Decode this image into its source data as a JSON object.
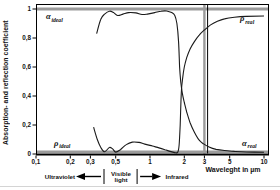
{
  "figure": {
    "axes": {
      "y_title": "Absorption- and reflection coefficient",
      "x_title": "Waveleght in µm",
      "x_scale": "log",
      "y_ticks": [
        {
          "label": "1",
          "value": 1.0
        },
        {
          "label": "0,8",
          "value": 0.8
        },
        {
          "label": "0,6",
          "value": 0.6
        },
        {
          "label": "0,4",
          "value": 0.4
        },
        {
          "label": "0,2",
          "value": 0.2
        },
        {
          "label": "0",
          "value": 0.0
        }
      ],
      "x_ticks": [
        {
          "label": "0,1",
          "value": 0.1
        },
        {
          "label": "0,2",
          "value": 0.2
        },
        {
          "label": "0,3",
          "value": 0.3
        },
        {
          "label": "0,5",
          "value": 0.5
        },
        {
          "label": "1",
          "value": 1
        },
        {
          "label": "2",
          "value": 2
        },
        {
          "label": "3",
          "value": 3
        },
        {
          "label": "5",
          "value": 5
        },
        {
          "label": "10",
          "value": 10
        }
      ]
    },
    "regions": {
      "ultraviolet": "Ultraviolet",
      "visible_line1": "Visible",
      "visible_line2": "light",
      "infrared": "Infrared",
      "separator_values_um": [
        0.395,
        0.77
      ]
    },
    "curve_labels": {
      "alpha_ideal": {
        "main": "α",
        "sub": "ideal"
      },
      "rho_ideal": {
        "main": "ρ",
        "sub": "ideal"
      },
      "rho_real": {
        "main": "ρ",
        "sub": "real"
      },
      "alpha_real": {
        "main": "α",
        "sub": "real"
      }
    },
    "colors": {
      "curve": "#1a1a1a",
      "ideal_gray": "#9b9b9b",
      "box": "#000000"
    }
  },
  "chart_data": {
    "type": "line",
    "title": "",
    "xlabel": "Waveleght in µm",
    "ylabel": "Absorption- and reflection coefficient",
    "x_scale": "log",
    "xlim": [
      0.1,
      10
    ],
    "ylim": [
      0,
      1
    ],
    "grid": false,
    "legend_position": "inline-labels",
    "ideal_step_um": 3,
    "series": [
      {
        "name": "alpha_ideal",
        "style": "thick-gray-step",
        "points": [
          [
            0.1,
            1
          ],
          [
            3,
            1
          ],
          [
            3,
            0
          ],
          [
            10,
            0
          ]
        ]
      },
      {
        "name": "rho_ideal",
        "style": "thick-gray-step",
        "points": [
          [
            0.1,
            0
          ],
          [
            3,
            0
          ],
          [
            3,
            1
          ],
          [
            10,
            1
          ]
        ]
      },
      {
        "name": "alpha_real",
        "style": "thin-black",
        "points": [
          [
            0.34,
            0.83
          ],
          [
            0.37,
            0.93
          ],
          [
            0.4,
            0.965
          ],
          [
            0.44,
            0.985
          ],
          [
            0.48,
            0.975
          ],
          [
            0.52,
            0.955
          ],
          [
            0.58,
            0.965
          ],
          [
            0.65,
            0.975
          ],
          [
            0.75,
            0.973
          ],
          [
            0.85,
            0.962
          ],
          [
            0.95,
            0.965
          ],
          [
            1.1,
            0.975
          ],
          [
            1.25,
            0.985
          ],
          [
            1.4,
            0.986
          ],
          [
            1.55,
            0.975
          ],
          [
            1.65,
            0.955
          ],
          [
            1.72,
            0.9
          ],
          [
            1.78,
            0.78
          ],
          [
            1.82,
            0.6
          ],
          [
            1.86,
            0.5
          ],
          [
            1.92,
            0.42
          ],
          [
            2.0,
            0.355
          ],
          [
            2.1,
            0.29
          ],
          [
            2.25,
            0.215
          ],
          [
            2.45,
            0.15
          ],
          [
            2.7,
            0.095
          ],
          [
            2.95,
            0.07
          ],
          [
            3.3,
            0.048
          ],
          [
            3.8,
            0.032
          ],
          [
            4.5,
            0.024
          ],
          [
            5.5,
            0.018
          ],
          [
            7,
            0.014
          ],
          [
            10,
            0.012
          ]
        ]
      },
      {
        "name": "rho_real",
        "style": "thin-black",
        "points": [
          [
            0.32,
            0.185
          ],
          [
            0.345,
            0.1
          ],
          [
            0.37,
            0.045
          ],
          [
            0.4,
            0.015
          ],
          [
            0.44,
            0.045
          ],
          [
            0.47,
            0.035
          ],
          [
            0.5,
            0.013
          ],
          [
            0.55,
            0.03
          ],
          [
            0.62,
            0.065
          ],
          [
            0.7,
            0.082
          ],
          [
            0.8,
            0.08
          ],
          [
            0.9,
            0.068
          ],
          [
            1.05,
            0.055
          ],
          [
            1.2,
            0.042
          ],
          [
            1.35,
            0.03
          ],
          [
            1.5,
            0.018
          ],
          [
            1.65,
            0.01
          ],
          [
            1.75,
            0.012
          ],
          [
            1.8,
            0.06
          ],
          [
            1.84,
            0.2
          ],
          [
            1.88,
            0.42
          ],
          [
            1.93,
            0.52
          ],
          [
            2.0,
            0.6
          ],
          [
            2.1,
            0.665
          ],
          [
            2.25,
            0.725
          ],
          [
            2.45,
            0.775
          ],
          [
            2.7,
            0.82
          ],
          [
            3.0,
            0.855
          ],
          [
            3.4,
            0.89
          ],
          [
            3.9,
            0.915
          ],
          [
            4.5,
            0.932
          ],
          [
            5.5,
            0.943
          ],
          [
            7,
            0.949
          ],
          [
            10,
            0.952
          ]
        ]
      }
    ]
  }
}
